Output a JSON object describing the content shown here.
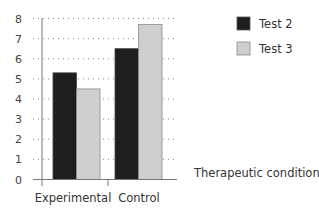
{
  "chart_data": {
    "type": "bar",
    "title": "",
    "xlabel": "Therapeutic condition",
    "ylabel": "",
    "categories": [
      "Experimental",
      "Control"
    ],
    "series": [
      {
        "name": "Test 2",
        "values": [
          5.3,
          6.5
        ],
        "color": "#1e1e1e"
      },
      {
        "name": "Test 3",
        "values": [
          4.5,
          7.7
        ],
        "color": "#cfcfcf"
      }
    ],
    "ylim": [
      0,
      8
    ],
    "yticks": [
      0,
      1,
      2,
      3,
      4,
      5,
      6,
      7,
      8
    ],
    "grid": true,
    "grid_style": "dotted",
    "legend_position": "top-right"
  },
  "legend": {
    "items": [
      {
        "label": "Test 2",
        "color": "#1e1e1e"
      },
      {
        "label": "Test 3",
        "color": "#cfcfcf"
      }
    ]
  },
  "axis": {
    "xlabel": "Therapeutic condition",
    "categories": [
      "Experimental",
      "Control"
    ],
    "yticks": [
      "0",
      "1",
      "2",
      "3",
      "4",
      "5",
      "6",
      "7",
      "8"
    ]
  }
}
